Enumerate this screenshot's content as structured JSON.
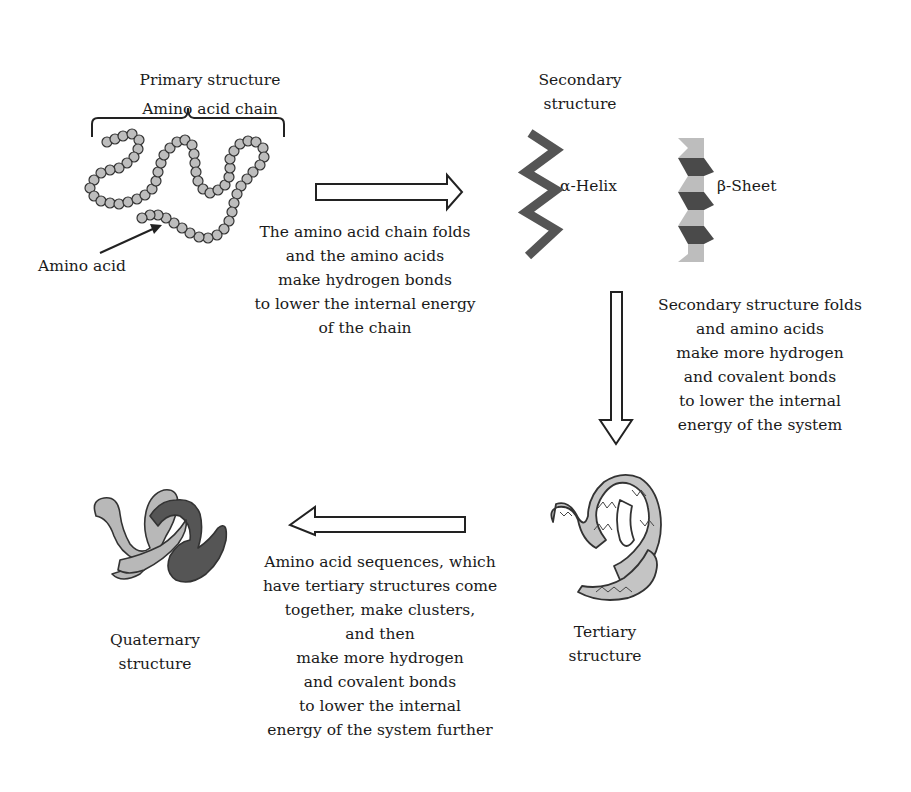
{
  "primary": {
    "title": "Primary structure",
    "chain_label": "Amino acid chain",
    "amino_acid_label": "Amino acid"
  },
  "secondary": {
    "title_line1": "Secondary",
    "title_line2": "structure",
    "helix_label": "α-Helix",
    "sheet_label": "β-Sheet"
  },
  "tertiary": {
    "title_line1": "Tertiary",
    "title_line2": "structure"
  },
  "quaternary": {
    "title_line1": "Quaternary",
    "title_line2": "structure"
  },
  "step1": {
    "lines": [
      "The amino acid chain folds",
      "and the amino acids",
      "make hydrogen bonds",
      "to lower the internal energy",
      "of the chain"
    ]
  },
  "step2": {
    "lines": [
      "Secondary structure folds",
      "and amino acids",
      "make more hydrogen",
      "and covalent bonds",
      "to lower the internal",
      "energy of the system"
    ]
  },
  "step3": {
    "lines": [
      "Amino acid sequences, which",
      "have tertiary structures come",
      "together, make clusters,",
      "and then",
      "make more hydrogen",
      "and covalent bonds",
      "to lower the internal",
      "energy of the system further"
    ]
  },
  "colors": {
    "text": "#1a1a1a",
    "helix": "#555555",
    "sheet_dark": "#4a4a4a",
    "sheet_light": "#bdbdbd",
    "bead_fill": "#bdbdbd",
    "tertiary_fill": "#c4c4c4",
    "quat_light": "#b8b8b8",
    "quat_dark": "#555555"
  }
}
